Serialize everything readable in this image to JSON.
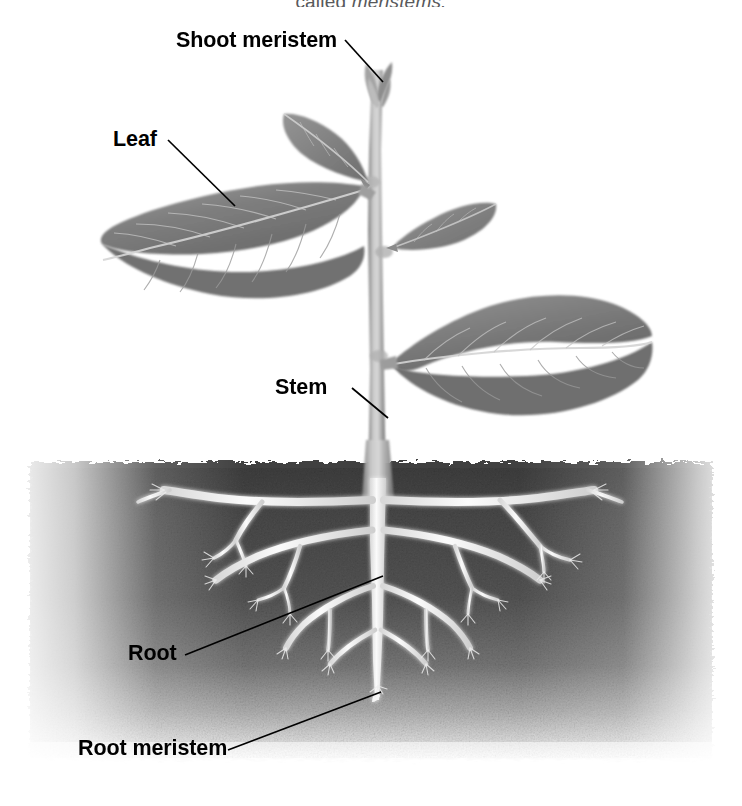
{
  "figure": {
    "title_fragment": "called ",
    "title_italic": "meristems.",
    "background_color": "#ffffff",
    "width": 742,
    "height": 806,
    "soil_color_dark": "#4a4a4a",
    "soil_color_light": "#c9c9c9",
    "plant_color": "#8a8a8a",
    "leaf_color": "#7d7d7d",
    "root_color": "#f2f2f2",
    "leader_color": "#000000"
  },
  "labels": [
    {
      "id": "shoot-meristem",
      "text": "Shoot meristem",
      "color": "#000000",
      "target": "apical bud at top of stem"
    },
    {
      "id": "leaf",
      "text": "Leaf",
      "color": "#000000",
      "target": "large left foliage leaf"
    },
    {
      "id": "stem",
      "text": "Stem",
      "color": "#000000",
      "target": "main vertical shoot axis"
    },
    {
      "id": "root",
      "text": "Root",
      "color": "#000000",
      "target": "lateral root branch"
    },
    {
      "id": "root-meristem",
      "text": "Root meristem",
      "color": "#000000",
      "target": "root tip of taproot"
    }
  ],
  "structures": {
    "soil_line_y": 462,
    "taproot_x": 378,
    "taproot_tip_y": 700,
    "stem_top_y": 62,
    "leaf_count": 4,
    "lateral_root_pairs": 5
  }
}
